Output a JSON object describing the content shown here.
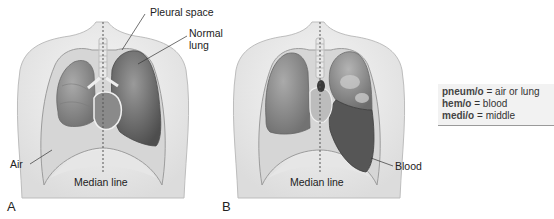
{
  "figure": {
    "panels": [
      {
        "id": "A",
        "letter": "A",
        "labels": {
          "pleural_space": "Pleural space",
          "normal_lung_line1": "Normal",
          "normal_lung_line2": "lung",
          "air": "Air",
          "median_line": "Median line"
        }
      },
      {
        "id": "B",
        "letter": "B",
        "labels": {
          "blood": "Blood",
          "median_line": "Median line"
        }
      }
    ],
    "legend": [
      {
        "term": "pneum/o",
        "sep": " = ",
        "meaning": "air or lung"
      },
      {
        "term": "hem/o",
        "sep": " = ",
        "meaning": "blood"
      },
      {
        "term": "medi/o",
        "sep": " = ",
        "meaning": "middle"
      }
    ],
    "colors": {
      "skin": "#ededed",
      "skin_outline": "#b5b5b5",
      "pleural_cavity": "#d9d9d9",
      "collapsed_lung": "#8d8d8d",
      "normal_lung": "#6e6e6e",
      "blood": "#5a5a5a",
      "legend_bg": "#f2f2f2"
    }
  }
}
